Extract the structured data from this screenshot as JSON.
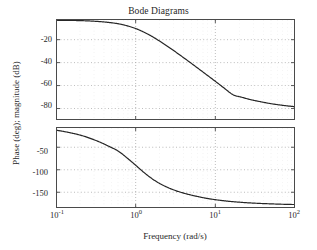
{
  "figure": {
    "title": "Bode Diagrams",
    "xlabel": "Frequency (rad/s)",
    "ylabel": "Phase (deg); magnitude (dB)",
    "background_color": "#ffffff",
    "axis_color": "#4a4a4a",
    "grid_color": "#a8a8a8",
    "curve_color": "#262626"
  },
  "ticks": {
    "magnitude_y": [
      "-20",
      "-40",
      "-60",
      "-80"
    ],
    "phase_y": [
      "-50",
      "-100",
      "-150"
    ],
    "x_mantissa": [
      "10",
      "10",
      "10",
      "10"
    ],
    "x_exponent": [
      "-1",
      "0",
      "1",
      "2"
    ]
  },
  "chart_data": [
    {
      "type": "line",
      "title": "Bode Diagrams",
      "subplot": "magnitude",
      "xlabel": "",
      "ylabel": "magnitude (dB)",
      "xscale": "log",
      "xlim": [
        0.1,
        100
      ],
      "ylim": [
        -90,
        -2
      ],
      "yticks": [
        -20,
        -40,
        -60,
        -80
      ],
      "xticks": [
        0.1,
        1,
        10,
        100
      ],
      "grid": true,
      "legend": "none",
      "x": [
        0.1,
        0.13,
        0.17,
        0.22,
        0.28,
        0.36,
        0.46,
        0.6,
        0.77,
        1.0,
        1.29,
        1.67,
        2.15,
        2.78,
        3.59,
        4.64,
        5.99,
        7.74,
        10.0,
        12.9,
        16.7,
        21.5,
        27.8,
        35.9,
        46.4,
        59.9,
        77.4,
        100.0
      ],
      "values": [
        -3.1,
        -3.2,
        -3.3,
        -3.5,
        -3.8,
        -4.3,
        -5.0,
        -6.1,
        -7.8,
        -10.3,
        -13.7,
        -17.9,
        -22.7,
        -27.9,
        -33.4,
        -39.0,
        -44.7,
        -50.5,
        -56.3,
        -62.2,
        -68.0,
        -70.2,
        -72.3,
        -73.9,
        -75.4,
        -76.6,
        -77.6,
        -78.4
      ]
    },
    {
      "type": "line",
      "subplot": "phase",
      "xlabel": "Frequency (rad/s)",
      "ylabel": "Phase (deg)",
      "xscale": "log",
      "xlim": [
        0.1,
        100
      ],
      "ylim": [
        -185,
        -5
      ],
      "yticks": [
        -50,
        -100,
        -150
      ],
      "xticks": [
        0.1,
        1,
        10,
        100
      ],
      "grid": true,
      "legend": "none",
      "x": [
        0.1,
        0.13,
        0.17,
        0.22,
        0.28,
        0.36,
        0.46,
        0.6,
        0.77,
        1.0,
        1.29,
        1.67,
        2.15,
        2.78,
        3.59,
        4.64,
        5.99,
        7.74,
        10.0,
        12.9,
        16.7,
        21.5,
        27.8,
        35.9,
        46.4,
        59.9,
        77.4,
        100.0
      ],
      "values": [
        -12.0,
        -15.5,
        -19.8,
        -25.0,
        -31.4,
        -39.0,
        -47.9,
        -58.2,
        -73.0,
        -90.0,
        -107.0,
        -122.0,
        -133.5,
        -142.5,
        -149.5,
        -155.0,
        -159.5,
        -163.5,
        -166.5,
        -169.0,
        -171.0,
        -172.5,
        -173.8,
        -174.8,
        -175.6,
        -176.3,
        -176.9,
        -177.3
      ]
    }
  ]
}
